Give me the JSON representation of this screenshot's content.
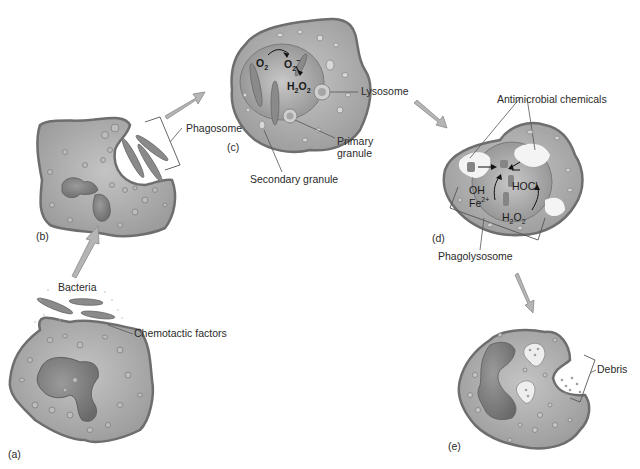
{
  "figure": {
    "colors": {
      "cytoplasm": "#a9a9a9",
      "cell_outline": "#6e6e6e",
      "nucleus": "#7d7d7d",
      "granule": "#bdbdbd",
      "bacteria": "#8a8a8a",
      "arrow": "#b5b5b5",
      "vacuole": "#f2f2f2"
    },
    "panels": {
      "a": {
        "label": "(a)",
        "callouts": {
          "bacteria": "Bacteria",
          "chemotactic": "Chemotactic factors"
        }
      },
      "b": {
        "label": "(b)",
        "callouts": {
          "phagosome": "Phagosome"
        }
      },
      "c": {
        "label": "(c)",
        "callouts": {
          "lysosome": "Lysosome",
          "primary_1": "Primary",
          "primary_2": "granule",
          "secondary": "Secondary granule"
        },
        "chem": {
          "o2": "O",
          "o2_sub": "2",
          "superoxide": "O",
          "superoxide_sub": "2",
          "superoxide_sup": "−",
          "h2o2_h": "H",
          "h2o2_sub1": "2",
          "h2o2_o": "O",
          "h2o2_sub2": "2"
        }
      },
      "d": {
        "label": "(d)",
        "callouts": {
          "antimicrobial": "Antimicrobial chemicals",
          "phagolysosome": "Phagolysosome"
        },
        "chem": {
          "oh": "OH",
          "fe": "Fe",
          "fe_sup": "2+",
          "hocl": "HOCl",
          "h2o2_h": "H",
          "h2o2_sub1": "2",
          "h2o2_o": "O",
          "h2o2_sub2": "2"
        }
      },
      "e": {
        "label": "(e)",
        "callouts": {
          "debris": "Debris"
        }
      }
    }
  }
}
